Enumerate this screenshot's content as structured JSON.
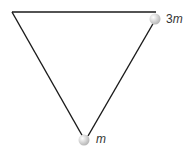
{
  "diagram": {
    "labels": {
      "top_mass_coeff": "3",
      "top_mass_var": "m",
      "bottom_mass_var": "m"
    },
    "colors": {
      "line": "#1a1a1a",
      "ball": "#d0d0d0"
    }
  }
}
